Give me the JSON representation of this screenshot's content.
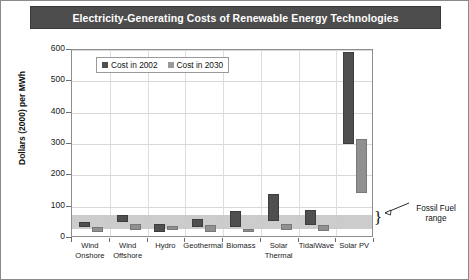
{
  "title": "Electricity-Generating Costs of Renewable Energy Technologies",
  "legend": {
    "items": [
      {
        "label": "Cost in 2002",
        "color": "#4f4f4f",
        "key": "cost_2002"
      },
      {
        "label": "Cost in 2030",
        "color": "#9a9a9a",
        "key": "cost_2030"
      }
    ]
  },
  "annotation": {
    "line1": "Fossil Fuel",
    "line2": "range"
  },
  "chart_data": {
    "type": "bar",
    "variant": "floating-range-bar",
    "title": "Electricity-Generating Costs of Renewable Energy Technologies",
    "xlabel": "",
    "ylabel": "Dollars (2000) per MWh",
    "ylim": [
      0,
      600
    ],
    "yticks": [
      0,
      100,
      200,
      300,
      400,
      500,
      600
    ],
    "ytick_labels": [
      "0",
      "100",
      "200",
      "300",
      "400",
      "500",
      "600"
    ],
    "grid": true,
    "legend_position": "upper-left-inside",
    "categories": [
      "Wind Onshore",
      "Wind Offshore",
      "Hydro",
      "Geothermal",
      "Biomass",
      "Solar Thermal",
      "TidalWave",
      "Solar PV"
    ],
    "category_labels_multiline": [
      [
        "Wind",
        "Onshore"
      ],
      [
        "Wind",
        "Offshore"
      ],
      [
        "Hydro",
        ""
      ],
      [
        "Geothermal",
        ""
      ],
      [
        "Biomass",
        ""
      ],
      [
        "Solar",
        "Thermal"
      ],
      [
        "TidalWave",
        ""
      ],
      [
        "Solar PV",
        ""
      ]
    ],
    "series": [
      {
        "name": "Cost in 2002",
        "color": "#4f4f4f",
        "ranges": [
          {
            "category": "Wind Onshore",
            "low": 35,
            "high": 50
          },
          {
            "category": "Wind Offshore",
            "low": 50,
            "high": 72
          },
          {
            "category": "Hydro",
            "low": 20,
            "high": 45
          },
          {
            "category": "Geothermal",
            "low": 35,
            "high": 62
          },
          {
            "category": "Biomass",
            "low": 35,
            "high": 85
          },
          {
            "category": "Solar Thermal",
            "low": 55,
            "high": 140
          },
          {
            "category": "TidalWave",
            "low": 40,
            "high": 90
          },
          {
            "category": "Solar PV",
            "low": 300,
            "high": 595
          }
        ]
      },
      {
        "name": "Cost in 2030",
        "color": "#9a9a9a",
        "ranges": [
          {
            "category": "Wind Onshore",
            "low": 20,
            "high": 35
          },
          {
            "category": "Wind Offshore",
            "low": 25,
            "high": 45
          },
          {
            "category": "Hydro",
            "low": 25,
            "high": 37
          },
          {
            "category": "Geothermal",
            "low": 20,
            "high": 42
          },
          {
            "category": "Biomass",
            "low": 18,
            "high": 30
          },
          {
            "category": "Solar Thermal",
            "low": 25,
            "high": 45
          },
          {
            "category": "TidalWave",
            "low": 22,
            "high": 42
          },
          {
            "category": "Solar PV",
            "low": 145,
            "high": 315
          }
        ]
      }
    ],
    "annotations": [
      {
        "text": "Fossil Fuel range",
        "type": "band-callout",
        "band_low": 30,
        "band_high": 75,
        "band_color": "#c9c9c9"
      }
    ]
  }
}
